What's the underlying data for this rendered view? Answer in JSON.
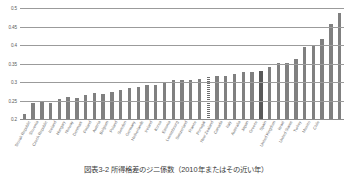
{
  "chart_data": {
    "type": "bar",
    "title": "",
    "xlabel": "",
    "ylabel": "",
    "ylim": [
      0.2,
      0.5
    ],
    "yticks": [
      "0.2",
      "0.25",
      "0.3",
      "0.35",
      "0.4",
      "0.45",
      "0.5"
    ],
    "ytick_values": [
      0.2,
      0.25,
      0.3,
      0.35,
      0.4,
      0.45,
      0.5
    ],
    "grid": true,
    "legend": "none",
    "categories": [
      "Slovak Republic",
      "Slovenia",
      "Czech Republic",
      "Iceland",
      "Hungary",
      "Norway",
      "Denmark",
      "Finland",
      "Austria",
      "Belgium",
      "Poland",
      "Sweden",
      "Germany",
      "Netherlands",
      "Ireland",
      "Korea",
      "Estonia",
      "Luxembourg",
      "Switzerland",
      "France",
      "Portugal",
      "New Zealand",
      "Canada",
      "Italy",
      "Australia",
      "Japan",
      "Greece",
      "Spain",
      "United Kingdom",
      "Israel",
      "United States",
      "Turkey",
      "Mexico",
      "Chile"
    ],
    "values": [
      0.215,
      0.245,
      0.248,
      0.247,
      0.257,
      0.261,
      0.26,
      0.267,
      0.272,
      0.271,
      0.276,
      0.281,
      0.287,
      0.289,
      0.294,
      0.294,
      0.301,
      0.307,
      0.308,
      0.309,
      0.311,
      0.317,
      0.32,
      0.32,
      0.324,
      0.33,
      0.331,
      0.333,
      0.342,
      0.354,
      0.355,
      0.366,
      0.396,
      0.4
    ],
    "extra_values": [
      0.419,
      0.459,
      0.488
    ],
    "highlight_hatched_index": 21,
    "highlight_dark_index": 27,
    "colors": {
      "bar": "#808080",
      "bar_highlight_dark": "#595959",
      "bar_highlight_hatch": "#6e6e6e",
      "gridline": "#9b9b9b",
      "tick_text": "#5a5a5a"
    }
  },
  "caption": "図表3-2 所得格差のジニ係数（2010年またはその近い年）"
}
